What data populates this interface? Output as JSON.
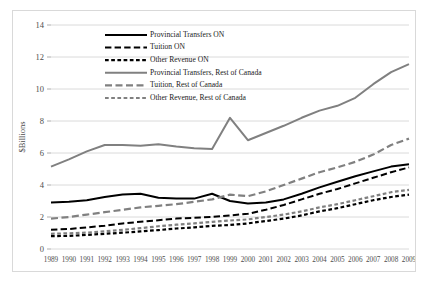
{
  "chart_data": {
    "type": "line",
    "title": "",
    "xlabel": "",
    "ylabel": "$Billions",
    "ylim": [
      0,
      14
    ],
    "yticks": [
      0,
      2,
      4,
      6,
      8,
      10,
      12,
      14
    ],
    "grid": true,
    "legend_position": "inside-top-left",
    "x": [
      1989,
      1990,
      1991,
      1992,
      1993,
      1994,
      1995,
      1996,
      1997,
      1998,
      1999,
      2000,
      2001,
      2002,
      2003,
      2004,
      2005,
      2006,
      2007,
      2008,
      2009
    ],
    "categories": [
      "1989",
      "1990",
      "1991",
      "1992",
      "1993",
      "1994",
      "1995",
      "1996",
      "1997",
      "1998",
      "1999",
      "2000",
      "2001",
      "2002",
      "2003",
      "2004",
      "2005",
      "2006",
      "2007",
      "2008",
      "2009"
    ],
    "series": [
      {
        "name": "Provincial Transfers ON",
        "color": "#000000",
        "style": "solid",
        "width": 2.0,
        "values": [
          2.9,
          2.95,
          3.05,
          3.25,
          3.4,
          3.45,
          3.2,
          3.15,
          3.15,
          3.45,
          3.0,
          2.85,
          2.9,
          3.1,
          3.45,
          3.85,
          4.2,
          4.55,
          4.85,
          5.15,
          5.3
        ]
      },
      {
        "name": "Tuition ON",
        "color": "#000000",
        "style": "dash-long",
        "width": 2.0,
        "values": [
          1.2,
          1.25,
          1.35,
          1.45,
          1.6,
          1.7,
          1.8,
          1.9,
          1.95,
          2.0,
          2.1,
          2.2,
          2.45,
          2.75,
          3.1,
          3.45,
          3.75,
          4.1,
          4.45,
          4.8,
          5.1
        ]
      },
      {
        "name": "Other Revenue ON",
        "color": "#000000",
        "style": "dash-short",
        "width": 2.2,
        "values": [
          0.8,
          0.82,
          0.88,
          0.95,
          1.02,
          1.1,
          1.18,
          1.28,
          1.35,
          1.45,
          1.5,
          1.6,
          1.75,
          1.9,
          2.1,
          2.35,
          2.55,
          2.8,
          3.05,
          3.25,
          3.4
        ]
      },
      {
        "name": "Provincial Transfers, Rest of Canada",
        "color": "#808080",
        "style": "solid",
        "width": 2.0,
        "values": [
          5.15,
          5.6,
          6.1,
          6.5,
          6.5,
          6.45,
          6.55,
          6.4,
          6.3,
          6.25,
          8.2,
          6.8,
          7.25,
          7.7,
          8.2,
          8.65,
          8.95,
          9.45,
          10.3,
          11.05,
          11.55
        ]
      },
      {
        "name": "Tuition, Rest of Canada",
        "color": "#808080",
        "style": "dash-long",
        "width": 2.2,
        "values": [
          1.9,
          2.0,
          2.15,
          2.3,
          2.45,
          2.6,
          2.7,
          2.8,
          2.95,
          3.1,
          3.4,
          3.3,
          3.6,
          4.0,
          4.4,
          4.8,
          5.1,
          5.45,
          5.9,
          6.5,
          6.9
        ]
      },
      {
        "name": "Other Revenue, Rest of Canada",
        "color": "#808080",
        "style": "dash-short",
        "width": 2.2,
        "values": [
          0.95,
          0.98,
          1.02,
          1.1,
          1.2,
          1.3,
          1.42,
          1.52,
          1.6,
          1.7,
          1.78,
          1.85,
          2.0,
          2.15,
          2.35,
          2.6,
          2.8,
          3.05,
          3.3,
          3.55,
          3.7
        ]
      }
    ]
  },
  "legend": {
    "items": [
      {
        "label": "Provincial Transfers ON"
      },
      {
        "label": "Tuition ON"
      },
      {
        "label": "Other Revenue ON"
      },
      {
        "label": "Provincial Transfers, Rest of Canada"
      },
      {
        "label": "Tuition, Rest of Canada"
      },
      {
        "label": "Other Revenue, Rest of Canada"
      }
    ]
  },
  "axes": {
    "y_title": "$Billions",
    "y_labels": [
      "0",
      "2",
      "4",
      "6",
      "8",
      "10",
      "12",
      "14"
    ],
    "x_labels": [
      "1989",
      "1990",
      "1991",
      "1992",
      "1993",
      "1994",
      "1995",
      "1996",
      "1997",
      "1998",
      "1999",
      "2000",
      "2001",
      "2002",
      "2003",
      "2004",
      "2005",
      "2006",
      "2007",
      "2008",
      "2009"
    ]
  },
  "colors": {
    "ontario": "#000000",
    "rest_of_canada": "#808080",
    "grid": "#d0d0d0",
    "frame": "#d9d9d9",
    "text": "#4d4d4d"
  }
}
